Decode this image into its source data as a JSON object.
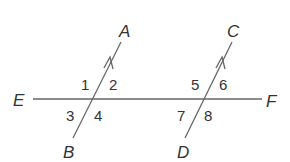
{
  "diagram": {
    "type": "parallel lines cut by transversal",
    "colors": {
      "line": "#666666",
      "text": "#333333",
      "background": "#ffffff"
    },
    "points": {
      "A": {
        "label": "A",
        "x": 124,
        "y": 35
      },
      "B": {
        "label": "B",
        "x": 68,
        "y": 158
      },
      "C": {
        "label": "C",
        "x": 232,
        "y": 35
      },
      "D": {
        "label": "D",
        "x": 183,
        "y": 158
      },
      "E": {
        "label": "E",
        "x": 12,
        "y": 107
      },
      "F": {
        "label": "F",
        "x": 268,
        "y": 108
      }
    },
    "lines": [
      {
        "name": "EF",
        "x1": 33,
        "y1": 99,
        "x2": 262,
        "y2": 99
      },
      {
        "name": "AB",
        "x1": 73,
        "y1": 138,
        "x2": 121,
        "y2": 42,
        "arrow": true
      },
      {
        "name": "CD",
        "x1": 185,
        "y1": 138,
        "x2": 232,
        "y2": 42,
        "arrow": true
      }
    ],
    "angles": [
      {
        "label": "1",
        "x": 81,
        "y": 90
      },
      {
        "label": "2",
        "x": 109,
        "y": 90
      },
      {
        "label": "3",
        "x": 66,
        "y": 121
      },
      {
        "label": "4",
        "x": 94,
        "y": 121
      },
      {
        "label": "5",
        "x": 191,
        "y": 90
      },
      {
        "label": "6",
        "x": 219,
        "y": 90
      },
      {
        "label": "7",
        "x": 177,
        "y": 121
      },
      {
        "label": "8",
        "x": 204,
        "y": 121
      }
    ]
  }
}
